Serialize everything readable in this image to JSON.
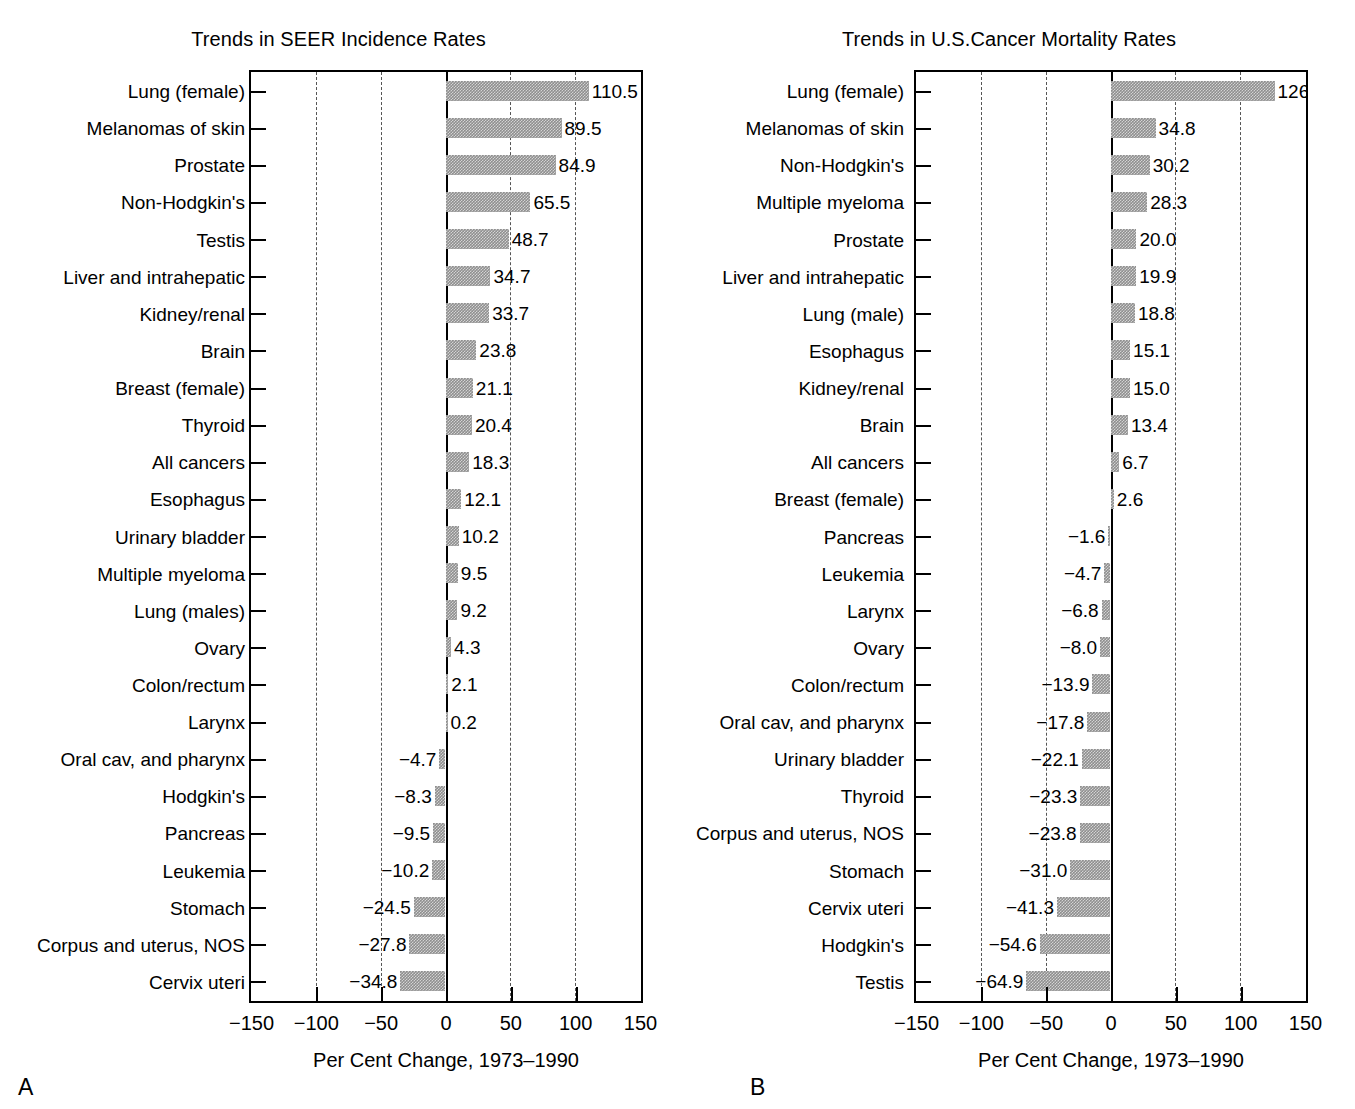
{
  "figure": {
    "background": "#ffffff",
    "bar_color": "#8f8f8f",
    "axis_color": "#000000"
  },
  "chart_data": [
    {
      "type": "bar",
      "orientation": "horizontal",
      "panel_letter": "A",
      "title": "Trends in SEER Incidence Rates",
      "xlabel": "Per Cent Change, 1973–1990",
      "ylabel": "",
      "xlim": [
        -150,
        150
      ],
      "xticks": [
        -150,
        -100,
        -50,
        0,
        50,
        100,
        150
      ],
      "xticklabels": [
        "−150",
        "−100",
        "−50",
        "0",
        "50",
        "100",
        "150"
      ],
      "grid": "vertical-dashed",
      "legend": "none",
      "categories": [
        "Lung (female)",
        "Melanomas of skin",
        "Prostate",
        "Non-Hodgkin's",
        "Testis",
        "Liver and intrahepatic",
        "Kidney/renal",
        "Brain",
        "Breast (female)",
        "Thyroid",
        "All cancers",
        "Esophagus",
        "Urinary bladder",
        "Multiple myeloma",
        "Lung (males)",
        "Ovary",
        "Colon/rectum",
        "Larynx",
        "Oral cav, and pharynx",
        "Hodgkin's",
        "Pancreas",
        "Leukemia",
        "Stomach",
        "Corpus and uterus, NOS",
        "Cervix uteri"
      ],
      "values": [
        110.5,
        89.5,
        84.9,
        65.5,
        48.7,
        34.7,
        33.7,
        23.8,
        21.1,
        20.4,
        18.3,
        12.1,
        10.2,
        9.5,
        9.2,
        4.3,
        2.1,
        0.2,
        -4.7,
        -8.3,
        -9.5,
        -10.2,
        -24.5,
        -27.8,
        -34.8
      ],
      "data_labels": [
        "110.5",
        "89.5",
        "84.9",
        "65.5",
        "48.7",
        "34.7",
        "33.7",
        "23.8",
        "21.1",
        "20.4",
        "18.3",
        "12.1",
        "10.2",
        "9.5",
        "9.2",
        "4.3",
        "2.1",
        "0.2",
        "−4.7",
        "−8.3",
        "−9.5",
        "−10.2",
        "−24.5",
        "−27.8",
        "−34.8"
      ]
    },
    {
      "type": "bar",
      "orientation": "horizontal",
      "panel_letter": "B",
      "title": "Trends in U.S.Cancer Mortality Rates",
      "xlabel": "Per Cent Change, 1973–1990",
      "ylabel": "",
      "xlim": [
        -150,
        150
      ],
      "xticks": [
        -150,
        -100,
        -50,
        0,
        50,
        100,
        150
      ],
      "xticklabels": [
        "−150",
        "−100",
        "−50",
        "0",
        "50",
        "100",
        "150"
      ],
      "grid": "vertical-dashed",
      "legend": "none",
      "categories": [
        "Lung (female)",
        "Melanomas of skin",
        "Non-Hodgkin's",
        "Multiple myeloma",
        "Prostate",
        "Liver and intrahepatic",
        "Lung (male)",
        "Esophagus",
        "Kidney/renal",
        "Brain",
        "All cancers",
        "Breast (female)",
        "Pancreas",
        "Leukemia",
        "Larynx",
        "Ovary",
        "Colon/rectum",
        "Oral cav, and pharynx",
        "Urinary bladder",
        "Thyroid",
        "Corpus and uterus, NOS",
        "Stomach",
        "Cervix uteri",
        "Hodgkin's",
        "Testis"
      ],
      "values": [
        126.5,
        34.8,
        30.2,
        28.3,
        20.0,
        19.9,
        18.8,
        15.1,
        15.0,
        13.4,
        6.7,
        2.6,
        -1.6,
        -4.7,
        -6.8,
        -8.0,
        -13.9,
        -17.8,
        -22.1,
        -23.3,
        -23.8,
        -31.0,
        -41.3,
        -54.6,
        -64.9
      ],
      "data_labels": [
        "126.5",
        "34.8",
        "30.2",
        "28.3",
        "20.0",
        "19.9",
        "18.8",
        "15.1",
        "15.0",
        "13.4",
        "6.7",
        "2.6",
        "−1.6",
        "−4.7",
        "−6.8",
        "−8.0",
        "−13.9",
        "−17.8",
        "−22.1",
        "−23.3",
        "−23.8",
        "−31.0",
        "−41.3",
        "−54.6",
        "−64.9"
      ]
    }
  ]
}
